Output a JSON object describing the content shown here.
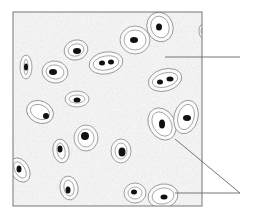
{
  "diagram": {
    "title": "",
    "colors": {
      "matrix": "#f4f4f4",
      "border": "#777777",
      "capsule_line": "#8a8a8a",
      "nucleus": "#111111",
      "leader_line": "#666666"
    },
    "frame": {
      "x": 13,
      "y": 12,
      "width": 189,
      "height": 194
    },
    "cells": [
      {
        "id": "a",
        "cx": 76,
        "cy": 50,
        "rx": 12,
        "ry": 10,
        "rot": -15,
        "nuclei": [
          [
            77,
            51,
            4,
            3
          ]
        ]
      },
      {
        "id": "b",
        "cx": 26,
        "cy": 67,
        "rx": 6,
        "ry": 12,
        "rot": 0,
        "nuclei": [
          [
            26,
            67,
            2,
            3.5
          ]
        ]
      },
      {
        "id": "c",
        "cx": 55,
        "cy": 72,
        "rx": 13,
        "ry": 11,
        "rot": 10,
        "nuclei": [
          [
            53,
            72,
            4,
            3
          ]
        ]
      },
      {
        "id": "d",
        "cx": 106,
        "cy": 63,
        "rx": 17,
        "ry": 11,
        "rot": -10,
        "nuclei": [
          [
            102,
            63,
            3,
            2.5
          ],
          [
            111,
            62,
            3,
            2.5
          ]
        ]
      },
      {
        "id": "e",
        "cx": 135,
        "cy": 40,
        "rx": 15,
        "ry": 14,
        "rot": 0,
        "nuclei": [
          [
            134,
            40,
            4,
            3
          ]
        ]
      },
      {
        "id": "f",
        "cx": 160,
        "cy": 27,
        "rx": 13,
        "ry": 15,
        "rot": -20,
        "nuclei": [
          [
            159,
            27,
            3,
            3.5
          ]
        ]
      },
      {
        "id": "g",
        "cx": 203,
        "cy": 31,
        "rx": 4,
        "ry": 7,
        "rot": 0,
        "nuclei": []
      },
      {
        "id": "h",
        "cx": 165,
        "cy": 80,
        "rx": 17,
        "ry": 11,
        "rot": -15,
        "nuclei": [
          [
            160,
            82,
            3,
            2.5
          ],
          [
            170,
            79,
            3.5,
            2.5
          ]
        ]
      },
      {
        "id": "i",
        "cx": 77,
        "cy": 99,
        "rx": 12,
        "ry": 8,
        "rot": 0,
        "nuclei": [
          [
            77,
            100,
            3.5,
            2.5
          ]
        ]
      },
      {
        "id": "j",
        "cx": 40,
        "cy": 112,
        "rx": 14,
        "ry": 11,
        "rot": 25,
        "nuclei": [
          [
            46,
            116,
            3,
            3
          ]
        ]
      },
      {
        "id": "k",
        "cx": 162,
        "cy": 124,
        "rx": 13,
        "ry": 17,
        "rot": -30,
        "nuclei": [
          [
            162,
            124,
            3,
            4.5
          ]
        ]
      },
      {
        "id": "l",
        "cx": 186,
        "cy": 117,
        "rx": 12,
        "ry": 17,
        "rot": 15,
        "nuclei": [
          [
            187,
            118,
            4,
            3
          ]
        ]
      },
      {
        "id": "m",
        "cx": 86,
        "cy": 138,
        "rx": 12,
        "ry": 13,
        "rot": 0,
        "nuclei": [
          [
            85,
            136,
            4,
            4
          ]
        ]
      },
      {
        "id": "n",
        "cx": 61,
        "cy": 151,
        "rx": 8,
        "ry": 12,
        "rot": -10,
        "nuclei": [
          [
            60,
            149,
            2.5,
            3.5
          ]
        ]
      },
      {
        "id": "o",
        "cx": 121,
        "cy": 151,
        "rx": 10,
        "ry": 12,
        "rot": 0,
        "nuclei": [
          [
            122,
            152,
            3.5,
            4.5
          ]
        ]
      },
      {
        "id": "p",
        "cx": 20,
        "cy": 170,
        "rx": 9,
        "ry": 13,
        "rot": -30,
        "nuclei": [
          [
            19,
            169,
            2.5,
            3.5
          ]
        ]
      },
      {
        "id": "q",
        "cx": 69,
        "cy": 188,
        "rx": 9,
        "ry": 12,
        "rot": -10,
        "nuclei": [
          [
            68,
            190,
            2.5,
            3.5
          ]
        ]
      },
      {
        "id": "r",
        "cx": 135,
        "cy": 193,
        "rx": 11,
        "ry": 10,
        "rot": 0,
        "nuclei": [
          [
            134,
            192,
            3,
            2.5
          ]
        ]
      },
      {
        "id": "s",
        "cx": 163,
        "cy": 196,
        "rx": 15,
        "ry": 12,
        "rot": -10,
        "nuclei": [
          [
            164,
            197,
            3.5,
            2.5
          ]
        ]
      }
    ],
    "leader_lines": [
      {
        "label": "",
        "points": [
          [
            165,
            57
          ],
          [
            240,
            57
          ]
        ]
      },
      {
        "label": "",
        "points": [
          [
            175,
            139
          ],
          [
            240,
            193
          ]
        ]
      },
      {
        "label": "",
        "points": [
          [
            175,
            193
          ],
          [
            240,
            193
          ]
        ]
      }
    ]
  }
}
